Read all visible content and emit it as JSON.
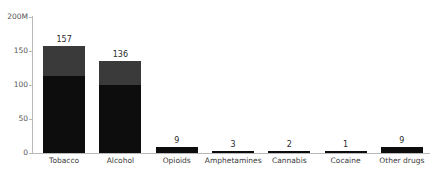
{
  "chart_data": {
    "type": "bar",
    "subtype": "stacked-bar",
    "title": "",
    "xlabel": "",
    "ylabel": "",
    "categories": [
      "Tobacco",
      "Alcohol",
      "Opioids",
      "Amphetamines",
      "Cannabis",
      "Cocaine",
      "Other drugs"
    ],
    "totals": [
      157,
      136,
      9,
      3,
      2,
      1,
      9
    ],
    "unit": "M",
    "series": [
      {
        "name": "Male",
        "values": [
          113,
          100,
          9,
          3,
          2,
          1,
          9
        ]
      },
      {
        "name": "Female",
        "values": [
          44,
          36,
          0,
          0,
          0,
          0,
          0
        ]
      }
    ],
    "ylim": [
      0,
      200
    ],
    "yticks": [
      0,
      50,
      100,
      150,
      200
    ],
    "ytick_labels": [
      "0",
      "50",
      "100",
      "150",
      "200M"
    ],
    "grid": false,
    "legend": "in-bar",
    "inbar_labels": [
      "Female",
      "Male"
    ],
    "colors": {
      "male": "#0d0d0d",
      "female": "#3a3a3a",
      "axis": "#b8b8b8",
      "tick_text": "#555555",
      "category_text": "#3a3a3a",
      "value_text": "#2b2b2b",
      "inbar_text": "#e8e8e8",
      "background": "#ffffff"
    }
  },
  "axis": {
    "ticks": [
      {
        "label": "200M",
        "value": 200
      },
      {
        "label": "150",
        "value": 150
      },
      {
        "label": "100",
        "value": 100
      },
      {
        "label": "50",
        "value": 50
      },
      {
        "label": "0",
        "value": 0
      }
    ]
  },
  "bars": [
    {
      "category": "Tobacco",
      "total_label": "157",
      "male": 113,
      "female": 44,
      "male_label": "Male",
      "female_label": "Female"
    },
    {
      "category": "Alcohol",
      "total_label": "136",
      "male": 100,
      "female": 36,
      "male_label": "",
      "female_label": ""
    },
    {
      "category": "Opioids",
      "total_label": "9",
      "male": 9,
      "female": 0,
      "male_label": "",
      "female_label": ""
    },
    {
      "category": "Amphetamines",
      "total_label": "3",
      "male": 3,
      "female": 0,
      "male_label": "",
      "female_label": ""
    },
    {
      "category": "Cannabis",
      "total_label": "2",
      "male": 2,
      "female": 0,
      "male_label": "",
      "female_label": ""
    },
    {
      "category": "Cocaine",
      "total_label": "1",
      "male": 1,
      "female": 0,
      "male_label": "",
      "female_label": ""
    },
    {
      "category": "Other drugs",
      "total_label": "9",
      "male": 9,
      "female": 0,
      "male_label": "",
      "female_label": ""
    }
  ]
}
